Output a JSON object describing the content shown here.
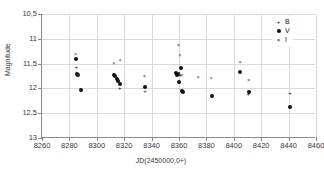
{
  "chart_data": {
    "type": "scatter",
    "title": "",
    "xlabel": "JD(2450000,0+)",
    "ylabel": "Magnitude",
    "xlim": [
      8260,
      8460
    ],
    "ylim": [
      10.5,
      13.0
    ],
    "y_inverted": true,
    "grid": true,
    "legend_position": "top-right",
    "xticks": [
      8260,
      8280,
      8300,
      8320,
      8340,
      8360,
      8380,
      8400,
      8420,
      8440,
      8460
    ],
    "xticklabels": [
      "8260",
      "8280",
      "8300",
      "8320",
      "8340",
      "8360",
      "8380",
      "8400",
      "8420",
      "8440",
      "8460"
    ],
    "yticks": [
      10.5,
      11.0,
      11.5,
      12.0,
      12.5,
      13.0
    ],
    "yticklabels": [
      "10,5",
      "11",
      "11,5",
      "12",
      "12,5",
      "13"
    ],
    "series": [
      {
        "name": "B",
        "marker": "plus",
        "color": "#111111",
        "points": [
          [
            8285.0,
            11.56
          ],
          [
            8285.4,
            11.72
          ],
          [
            8316.8,
            12.0
          ],
          [
            8335.2,
            12.05
          ],
          [
            8360.2,
            11.7
          ],
          [
            8360.8,
            11.72
          ],
          [
            8362.6,
            12.07
          ],
          [
            8410.6,
            12.12
          ],
          [
            8441.0,
            12.1
          ]
        ]
      },
      {
        "name": "V",
        "marker": "circle",
        "color": "#111111",
        "points": [
          [
            8284.8,
            11.4
          ],
          [
            8285.2,
            11.71
          ],
          [
            8286.0,
            11.72
          ],
          [
            8288.2,
            12.04
          ],
          [
            8312.8,
            11.72
          ],
          [
            8313.6,
            11.76
          ],
          [
            8314.6,
            11.82
          ],
          [
            8315.6,
            11.86
          ],
          [
            8316.6,
            11.92
          ],
          [
            8335.0,
            11.97
          ],
          [
            8357.6,
            11.68
          ],
          [
            8358.6,
            11.72
          ],
          [
            8359.6,
            11.7
          ],
          [
            8360.0,
            11.88
          ],
          [
            8361.4,
            11.58
          ],
          [
            8362.2,
            12.06
          ],
          [
            8363.0,
            12.07
          ],
          [
            8383.8,
            12.15
          ],
          [
            8404.8,
            11.66
          ],
          [
            8411.0,
            12.08
          ],
          [
            8441.0,
            12.38
          ]
        ]
      },
      {
        "name": "I",
        "marker": "cross",
        "color": "#4a4a4a",
        "points": [
          [
            8284.6,
            11.33
          ],
          [
            8286.2,
            11.74
          ],
          [
            8312.4,
            11.51
          ],
          [
            8317.0,
            11.45
          ],
          [
            8334.8,
            11.78
          ],
          [
            8359.6,
            11.15
          ],
          [
            8360.6,
            11.35
          ],
          [
            8360.0,
            11.7
          ],
          [
            8362.0,
            11.76
          ],
          [
            8374.0,
            11.8
          ],
          [
            8383.4,
            11.82
          ],
          [
            8404.6,
            11.48
          ],
          [
            8410.8,
            11.85
          ]
        ]
      }
    ]
  },
  "legend": {
    "entries": [
      {
        "symbol": "+",
        "label": "B",
        "marker": "plus-icon"
      },
      {
        "symbol": "●",
        "label": "V",
        "marker": "dot-icon"
      },
      {
        "symbol": "×",
        "label": "I",
        "marker": "cross-icon"
      }
    ]
  },
  "caption": ""
}
